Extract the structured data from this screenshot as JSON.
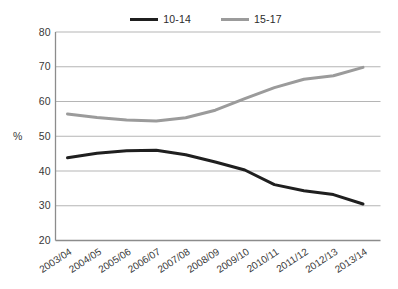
{
  "chart_data": {
    "type": "line",
    "title": "",
    "ylabel": "%",
    "xlabel": "",
    "ylim": [
      20,
      80
    ],
    "yticks": [
      80,
      70,
      60,
      50,
      40,
      30,
      20
    ],
    "grid": true,
    "legend_position": "top-center",
    "categories": [
      "2003/04",
      "2004/05",
      "2005/06",
      "2006/07",
      "2007/08",
      "2008/09",
      "2009/10",
      "2010/11",
      "2011/12",
      "2012/13",
      "2013/14"
    ],
    "series": [
      {
        "name": "10-14",
        "color": "#1f1f1f",
        "values": [
          43.8,
          45.1,
          45.8,
          46.0,
          44.7,
          42.6,
          40.3,
          36.1,
          34.3,
          33.2,
          30.5
        ]
      },
      {
        "name": "15-17",
        "color": "#9b9b9b",
        "values": [
          56.4,
          55.4,
          54.7,
          54.4,
          55.3,
          57.5,
          60.8,
          64.0,
          66.4,
          67.4,
          69.8
        ]
      }
    ],
    "colors": {
      "gridline": "#b5b5b5",
      "axis": "#8c8c8c",
      "text": "#383838"
    }
  }
}
